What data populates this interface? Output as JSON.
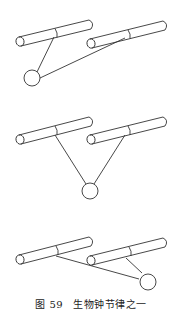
{
  "figure": {
    "caption_prefix": "图 59",
    "caption_title": "生物钟节律之一",
    "stroke_color": "#333333",
    "panels": [
      {
        "id": "panel-1",
        "description": "ball hangs below-left; strings attach to left rod midpoint and right rod midpoint",
        "ball_position": "lower-left"
      },
      {
        "id": "panel-2",
        "description": "ball hangs centered below both rods",
        "ball_position": "center"
      },
      {
        "id": "panel-3",
        "description": "ball swung to lower-right",
        "ball_position": "lower-right"
      }
    ]
  }
}
